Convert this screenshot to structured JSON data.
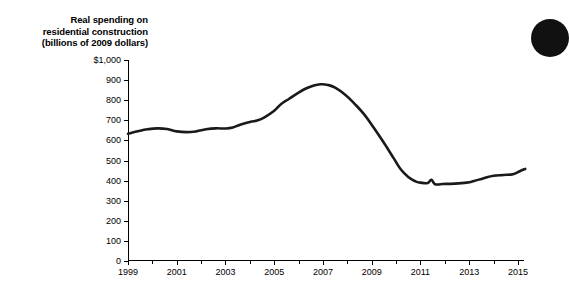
{
  "figure": {
    "background_color": "#ffffff",
    "ink_color": "#1a1a1a",
    "bullet": {
      "name": "corner-bullet",
      "color": "#111111"
    }
  },
  "chart_data": {
    "type": "line",
    "title": "Real spending on residential construction (billions of 2009 dollars)",
    "title_lines": [
      "Real spending on",
      "residential construction",
      "(billions of 2009 dollars)"
    ],
    "xlabel": "",
    "ylabel": "",
    "xlim": [
      1999,
      2015.25
    ],
    "ylim": [
      0,
      1000
    ],
    "grid": false,
    "legend": null,
    "y_ticks": [
      0,
      100,
      200,
      300,
      400,
      500,
      600,
      700,
      800,
      900,
      1000
    ],
    "y_tick_labels": [
      "0",
      "100",
      "200",
      "300",
      "400",
      "500",
      "600",
      "700",
      "800",
      "900",
      "$1,000"
    ],
    "x_ticks": [
      1999,
      2001,
      2003,
      2005,
      2007,
      2009,
      2011,
      2013,
      2015
    ],
    "x_tick_labels": [
      "1999",
      "2001",
      "2003",
      "2005",
      "2007",
      "2009",
      "2011",
      "2013",
      "2015"
    ],
    "x_minor_ticks": [
      2000,
      2002,
      2004,
      2006,
      2008,
      2010,
      2012,
      2014
    ],
    "series": [
      {
        "name": "Real spending on residential construction",
        "color": "#1a1a1a",
        "x": [
          1999.0,
          1999.25,
          1999.5,
          1999.75,
          2000.0,
          2000.25,
          2000.5,
          2000.75,
          2001.0,
          2001.25,
          2001.5,
          2001.75,
          2002.0,
          2002.25,
          2002.5,
          2002.75,
          2003.0,
          2003.25,
          2003.5,
          2003.75,
          2004.0,
          2004.25,
          2004.5,
          2004.75,
          2005.0,
          2005.25,
          2005.5,
          2005.75,
          2006.0,
          2006.25,
          2006.5,
          2006.75,
          2007.0,
          2007.25,
          2007.5,
          2007.75,
          2008.0,
          2008.25,
          2008.5,
          2008.75,
          2009.0,
          2009.25,
          2009.5,
          2009.75,
          2010.0,
          2010.25,
          2010.5,
          2010.75,
          2011.0,
          2011.25,
          2011.5,
          2011.75,
          2012.0,
          2012.25,
          2012.5,
          2012.75,
          2013.0,
          2013.25,
          2013.5,
          2013.75,
          2014.0,
          2014.25,
          2014.5,
          2014.75,
          2015.0,
          2015.25
        ],
        "y": [
          633,
          641,
          648,
          654,
          658,
          660,
          657,
          650,
          644,
          641,
          642,
          646,
          652,
          657,
          660,
          661,
          659,
          663,
          673,
          684,
          692,
          700,
          714,
          730,
          749,
          775,
          800,
          820,
          838,
          855,
          868,
          877,
          879,
          877,
          866,
          845,
          818,
          786,
          752,
          715,
          675,
          630,
          585,
          540,
          500,
          462,
          430,
          405,
          390,
          386,
          388,
          398,
          384,
          383,
          384,
          386,
          389,
          392,
          397,
          404,
          412,
          420,
          428,
          437,
          446,
          455
        ]
      }
    ],
    "annotations": []
  },
  "series_override": {
    "comment": "pixel-traced path for faithful rendering",
    "points": [
      [
        1999.0,
        633
      ],
      [
        1999.4,
        645
      ],
      [
        1999.8,
        655
      ],
      [
        2000.2,
        660
      ],
      [
        2000.6,
        657
      ],
      [
        2001.0,
        645
      ],
      [
        2001.4,
        641
      ],
      [
        2001.8,
        645
      ],
      [
        2002.2,
        655
      ],
      [
        2002.6,
        660
      ],
      [
        2003.0,
        659
      ],
      [
        2003.3,
        664
      ],
      [
        2003.6,
        678
      ],
      [
        2004.0,
        692
      ],
      [
        2004.3,
        699
      ],
      [
        2004.6,
        715
      ],
      [
        2005.0,
        748
      ],
      [
        2005.3,
        782
      ],
      [
        2005.6,
        806
      ],
      [
        2006.0,
        838
      ],
      [
        2006.3,
        858
      ],
      [
        2006.6,
        872
      ],
      [
        2006.9,
        879
      ],
      [
        2007.2,
        876
      ],
      [
        2007.5,
        862
      ],
      [
        2007.9,
        828
      ],
      [
        2008.3,
        782
      ],
      [
        2008.7,
        728
      ],
      [
        2009.1,
        660
      ],
      [
        2009.5,
        588
      ],
      [
        2009.9,
        512
      ],
      [
        2010.2,
        455
      ],
      [
        2010.5,
        418
      ],
      [
        2010.8,
        396
      ],
      [
        2011.0,
        390
      ],
      [
        2011.3,
        388
      ],
      [
        2011.45,
        404
      ],
      [
        2011.6,
        382
      ],
      [
        2011.9,
        383
      ],
      [
        2012.4,
        385
      ],
      [
        2012.9,
        390
      ],
      [
        2013.2,
        398
      ],
      [
        2013.6,
        412
      ],
      [
        2014.0,
        424
      ],
      [
        2014.4,
        428
      ],
      [
        2014.8,
        432
      ],
      [
        2015.1,
        448
      ],
      [
        2015.3,
        458
      ]
    ]
  }
}
